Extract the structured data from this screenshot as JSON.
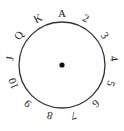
{
  "diagram": {
    "center": {
      "x": 62,
      "y": 65
    },
    "radius": 43,
    "label_radius": 52,
    "stroke_color": "#333333",
    "dot_color": "#111111",
    "labels": [
      "A",
      "2",
      "3",
      "4",
      "5",
      "6",
      "7",
      "8",
      "9",
      "10",
      "J",
      "Q",
      "K"
    ]
  }
}
